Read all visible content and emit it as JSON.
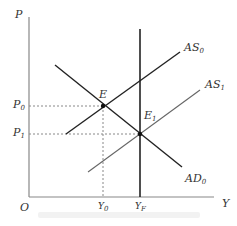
{
  "diagram": {
    "axes": {
      "y_label": "P",
      "x_label": "Y",
      "origin_label": "O"
    },
    "curves": [
      {
        "name": "AS",
        "sub": "0",
        "type": "aggregate-supply-initial"
      },
      {
        "name": "AS",
        "sub": "1",
        "type": "aggregate-supply-shifted"
      },
      {
        "name": "AD",
        "sub": "0",
        "type": "aggregate-demand"
      },
      {
        "name": "LRAS",
        "type": "vertical-full-employment"
      }
    ],
    "points": [
      {
        "name": "E",
        "sub": ""
      },
      {
        "name": "E",
        "sub": "1"
      }
    ],
    "ticks": {
      "P0": {
        "main": "P",
        "sub": "0"
      },
      "P1": {
        "main": "P",
        "sub": "1"
      },
      "Y0": {
        "main": "Y",
        "sub": "0"
      },
      "YF": {
        "main": "Y",
        "sub": "F"
      }
    },
    "colors": {
      "line": "#222222",
      "as1": "#666666",
      "axis": "#888888",
      "dashed": "#888888"
    }
  }
}
